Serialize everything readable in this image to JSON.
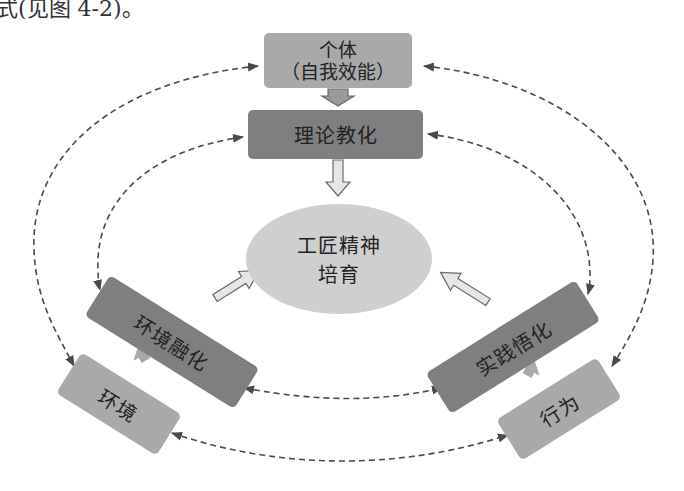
{
  "caption_fragment": "式(见图 4-2)。",
  "nodes": {
    "individual": {
      "line1": "个体",
      "line2": "（自我效能）"
    },
    "theory": {
      "label": "理论教化"
    },
    "center": {
      "line1": "工匠精神",
      "line2": "培育"
    },
    "env_integration": {
      "label": "环境融化"
    },
    "environment": {
      "label": "环境"
    },
    "practice": {
      "label": "实践悟化"
    },
    "behavior": {
      "label": "行为"
    }
  },
  "edges": [
    {
      "from": "individual",
      "to": "theory",
      "style": "block-arrow"
    },
    {
      "from": "theory",
      "to": "center",
      "style": "block-arrow"
    },
    {
      "from": "env_integration",
      "to": "center",
      "style": "block-arrow"
    },
    {
      "from": "practice",
      "to": "center",
      "style": "block-arrow"
    },
    {
      "from": "environment",
      "to": "env_integration",
      "style": "block-arrow"
    },
    {
      "from": "behavior",
      "to": "practice",
      "style": "block-arrow"
    },
    {
      "from": "individual",
      "to": "environment",
      "style": "dashed-bidirectional"
    },
    {
      "from": "individual",
      "to": "behavior",
      "style": "dashed-bidirectional"
    },
    {
      "from": "theory",
      "to": "env_integration",
      "style": "dashed-bidirectional"
    },
    {
      "from": "theory",
      "to": "practice",
      "style": "dashed-bidirectional"
    },
    {
      "from": "env_integration",
      "to": "practice",
      "style": "dashed-bidirectional"
    },
    {
      "from": "environment",
      "to": "behavior",
      "style": "dashed-bidirectional"
    }
  ],
  "colors": {
    "light_box": "#a9a9a9",
    "dark_box": "#7f7f7f",
    "ellipse": "#cfcfcf",
    "dashed_line": "#4a4a4a",
    "block_arrow_fill": "#e6e6e6"
  }
}
